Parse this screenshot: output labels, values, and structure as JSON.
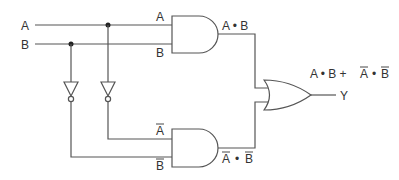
{
  "diagram": {
    "type": "logic-circuit",
    "inputs": [
      {
        "id": "A",
        "label": "A"
      },
      {
        "id": "B",
        "label": "B"
      }
    ],
    "gates": [
      {
        "id": "not_b",
        "type": "NOT",
        "input": "B"
      },
      {
        "id": "not_a",
        "type": "NOT",
        "input": "A"
      },
      {
        "id": "and_top",
        "type": "AND",
        "inputs": [
          "A",
          "B"
        ],
        "input_labels": [
          "A",
          "B"
        ],
        "output_label": "A • B"
      },
      {
        "id": "and_bottom",
        "type": "AND",
        "inputs": [
          "not_a",
          "not_b"
        ],
        "input_labels": [
          "A",
          "B"
        ],
        "input_overbars": [
          true,
          true
        ],
        "output_label_parts": [
          "A",
          " • ",
          "B"
        ],
        "output_overbars": [
          true,
          false,
          true
        ]
      },
      {
        "id": "or_out",
        "type": "OR",
        "inputs": [
          "and_top",
          "and_bottom"
        ]
      }
    ],
    "output": {
      "label": "Y",
      "expression_parts": [
        "A • B + ",
        "A",
        " • ",
        "B"
      ],
      "expression_overbars": [
        false,
        true,
        false,
        true
      ]
    }
  },
  "labels": {
    "input_a": "A",
    "input_b": "B",
    "and_top_in_a": "A",
    "and_top_in_b": "B",
    "and_top_out": "A • B",
    "and_bot_in_a": "A",
    "and_bot_in_b": "B",
    "and_bot_out_a": "A",
    "and_bot_out_dot": "•",
    "and_bot_out_b": "B",
    "expr_prefix": "A • B +",
    "expr_a": "A",
    "expr_dot": "•",
    "expr_b": "B",
    "output_y": "Y"
  },
  "colors": {
    "wire": "#555555",
    "text": "#333333",
    "junction": "#222222",
    "background": "#ffffff"
  }
}
